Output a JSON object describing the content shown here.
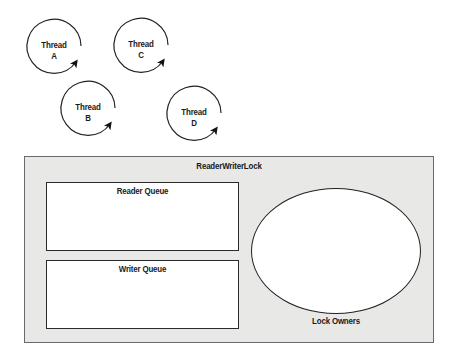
{
  "threads": [
    {
      "id": "A",
      "line1": "Thread",
      "line2": "A"
    },
    {
      "id": "B",
      "line1": "Thread",
      "line2": "B"
    },
    {
      "id": "C",
      "line1": "Thread",
      "line2": "C"
    },
    {
      "id": "D",
      "line1": "Thread",
      "line2": "D"
    }
  ],
  "lock": {
    "title": "ReaderWriterLock",
    "reader_queue": "Reader Queue",
    "writer_queue": "Writer Queue",
    "owners": "Lock Owners"
  },
  "colors": {
    "lock_background": "#e8e8e6",
    "stroke": "#222222",
    "box_fill": "#ffffff"
  }
}
